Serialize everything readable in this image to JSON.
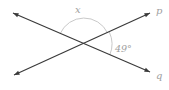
{
  "figure": {
    "labels": {
      "top_angle": "x",
      "right_angle": "49°",
      "ray_p": "p",
      "ray_q": "q"
    },
    "colors": {
      "line": "#3a3a3a",
      "arc": "#c9c9c9",
      "label": "#9e9e9e"
    }
  }
}
